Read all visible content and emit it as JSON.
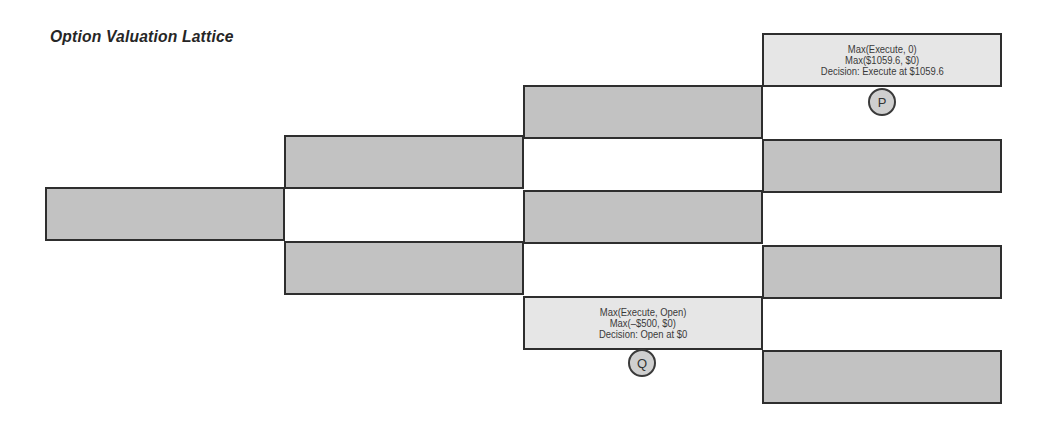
{
  "title": "Option Valuation Lattice",
  "colors": {
    "node_dark": "#c2c2c2",
    "node_light": "#e6e6e6",
    "border": "#2e2e2e"
  },
  "lattice": {
    "columns": [
      {
        "index": 0,
        "nodes": [
          {
            "id": "n0-0",
            "fill": "dark",
            "text": []
          }
        ]
      },
      {
        "index": 1,
        "nodes": [
          {
            "id": "n1-0",
            "fill": "dark",
            "text": []
          },
          {
            "id": "n1-1",
            "fill": "dark",
            "text": []
          }
        ]
      },
      {
        "index": 2,
        "nodes": [
          {
            "id": "n2-0",
            "fill": "dark",
            "text": []
          },
          {
            "id": "n2-1",
            "fill": "dark",
            "text": []
          },
          {
            "id": "n2-2",
            "fill": "light",
            "label": "Q",
            "text": [
              "Max(Execute, Open)",
              "Max(–$500, $0)",
              "Decision: Open at $0"
            ]
          }
        ]
      },
      {
        "index": 3,
        "nodes": [
          {
            "id": "n3-0",
            "fill": "light",
            "label": "P",
            "text": [
              "Max(Execute, 0)",
              "Max($1059.6, $0)",
              "Decision: Execute at $1059.6"
            ]
          },
          {
            "id": "n3-1",
            "fill": "dark",
            "text": []
          },
          {
            "id": "n3-2",
            "fill": "dark",
            "text": []
          },
          {
            "id": "n3-3",
            "fill": "dark",
            "text": []
          }
        ]
      }
    ]
  },
  "markers": {
    "p": "P",
    "q": "Q"
  },
  "node_p": {
    "line1": "Max(Execute, 0)",
    "line2": "Max($1059.6, $0)",
    "line3": "Decision: Execute at $1059.6"
  },
  "node_q": {
    "line1": "Max(Execute, Open)",
    "line2": "Max(–$500, $0)",
    "line3": "Decision: Open at $0"
  }
}
